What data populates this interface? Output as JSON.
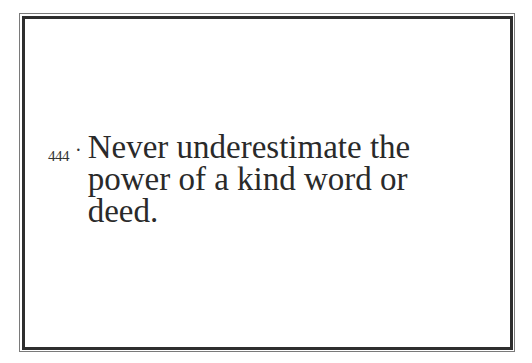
{
  "card": {
    "number": "444",
    "separator": "·",
    "lines": [
      "Never underestimate the",
      "power of a kind word or",
      "deed."
    ],
    "colors": {
      "text": "#2a2a2a",
      "border": "#2e2e2e"
    }
  }
}
